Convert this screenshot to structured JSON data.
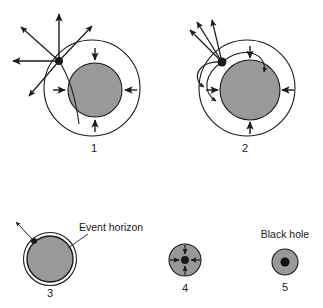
{
  "figure": {
    "background_color": "#ffffff",
    "star_fill_color": "#999999",
    "stroke_color": "#1a1a1a",
    "panels": [
      {
        "id": "panel-1",
        "number": "1",
        "description": "Collapsing star with straight light rays escaping in all directions",
        "star_fill": "#999999",
        "has_outer_circle": true,
        "emission_point": true,
        "ray_type": "straight",
        "infall_arrows": 4
      },
      {
        "id": "panel-2",
        "number": "2",
        "description": "Further collapsed star with light rays bending back toward the star",
        "star_fill": "#999999",
        "has_outer_circle": true,
        "emission_point": true,
        "ray_type": "curved",
        "infall_arrows": 4
      },
      {
        "id": "panel-3",
        "number": "3",
        "description": "Star at the event horizon, single escaping ray",
        "star_fill": "#999999",
        "has_outer_circle": false,
        "emission_point": true,
        "ray_type": "single-escape",
        "infall_arrows": 0
      },
      {
        "id": "panel-4",
        "number": "4",
        "description": "Star collapsed below the event horizon, all light falls inward",
        "star_fill": "#999999",
        "has_outer_circle": false,
        "emission_point": true,
        "ray_type": "inward",
        "infall_arrows": 4
      },
      {
        "id": "panel-5",
        "number": "5",
        "description": "Final black hole with central singularity",
        "star_fill": "#999999",
        "has_outer_circle": false,
        "emission_point": true,
        "ray_type": "none",
        "infall_arrows": 0
      }
    ],
    "labels": {
      "event_horizon": "Event horizon",
      "black_hole": "Black hole"
    }
  }
}
